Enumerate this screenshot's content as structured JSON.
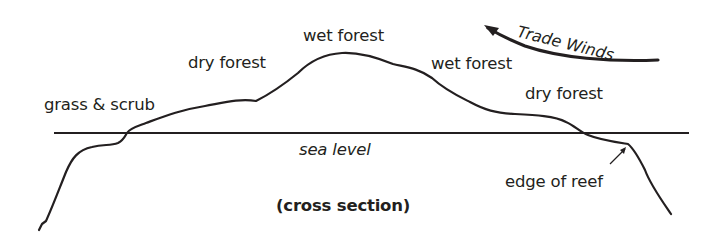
{
  "diagram": {
    "title": "(cross section)",
    "labels": {
      "grass_scrub": "grass & scrub",
      "dry_forest_left": "dry forest",
      "wet_forest_top": "wet forest",
      "wet_forest_right": "wet forest",
      "dry_forest_right": "dry forest",
      "sea_level": "sea level",
      "edge_of_reef": "edge of reef",
      "trade_winds": "Trade Winds"
    },
    "colors": {
      "line": "#231f20",
      "background": "#ffffff"
    }
  }
}
